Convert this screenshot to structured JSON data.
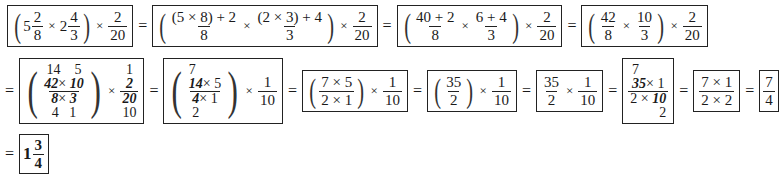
{
  "equals": "=",
  "times": "×",
  "row1": {
    "step1": {
      "whole1": "5",
      "num1": "2",
      "den1": "8",
      "whole2": "2",
      "num2": "4",
      "den2": "3",
      "num3": "2",
      "den3": "20"
    },
    "step2": {
      "num1": "(5 × 8) + 2",
      "den1": "8",
      "num2": "(2 × 3) + 4",
      "den2": "3",
      "num3": "2",
      "den3": "20"
    },
    "step3": {
      "num1": "40 + 2",
      "den1": "8",
      "num2": "6 + 4",
      "den2": "3",
      "num3": "2",
      "den3": "20"
    },
    "step4": {
      "num1": "42",
      "den1": "8",
      "num2": "10",
      "den2": "3",
      "num3": "2",
      "den3": "20"
    }
  },
  "row2": {
    "step5": {
      "top_cancel1": "14",
      "top_cancel2": "5",
      "num_a": "42",
      "num_b": "10",
      "den_a": "8",
      "den_b": "3",
      "bot_cancel1": "4",
      "bot_cancel2": "1",
      "r_top": "1",
      "r_num": "2",
      "r_den": "20",
      "r_bot": "10"
    },
    "step6": {
      "top_cancel": "7",
      "num_a": "14",
      "num_b": "5",
      "den_a": "4",
      "den_b": "1",
      "bot_cancel": "2",
      "num2": "1",
      "den2": "10"
    },
    "step7": {
      "num1": "7 × 5",
      "den1": "2 × 1",
      "num2": "1",
      "den2": "10"
    },
    "step8": {
      "num1": "35",
      "den1": "2",
      "num2": "1",
      "den2": "10"
    },
    "step9": {
      "num1": "35",
      "den1": "2",
      "num2": "1",
      "den2": "10"
    },
    "step10": {
      "top_cancel": "7",
      "num_a": "35",
      "num_b": "1",
      "den_a": "2",
      "den_b": "10",
      "bot_cancel": "2"
    },
    "step11": {
      "num": "7 × 1",
      "den": "2 × 2"
    },
    "step12": {
      "num": "7",
      "den": "4"
    }
  },
  "row3": {
    "answer": {
      "whole": "1",
      "num": "3",
      "den": "4"
    }
  }
}
